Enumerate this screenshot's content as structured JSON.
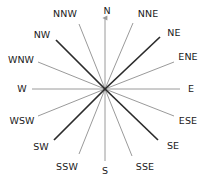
{
  "figure": {
    "background_color": "#ffffff",
    "center": {
      "x": 105,
      "y": 89
    },
    "line_colors": {
      "primary": "#2b2b2b",
      "secondary": "#9a9a9a"
    },
    "text_color": "#1a1a1a",
    "north_arrow": {
      "present": true,
      "points_to": "N",
      "color": "#9a9a9a"
    }
  },
  "chart_data": {
    "type": "diagram",
    "subtype": "compass-rose",
    "center": {
      "x": 105,
      "y": 89
    },
    "point_count": 16,
    "labels": [
      "N",
      "NNE",
      "NE",
      "ENE",
      "E",
      "ESE",
      "SE",
      "SSE",
      "S",
      "SSW",
      "SW",
      "WSW",
      "W",
      "WNW",
      "NW",
      "NNW"
    ],
    "points": [
      {
        "label": "N",
        "bearing_deg": 0,
        "weight": "light",
        "color": "#9a9a9a",
        "ray": {
          "x1": 105,
          "y1": 89,
          "x2": 105,
          "y2": 18
        },
        "label_pos": {
          "x": 107,
          "y": 11
        },
        "arrow": true
      },
      {
        "label": "NNE",
        "bearing_deg": 22.5,
        "weight": "light",
        "color": "#9a9a9a",
        "ray": {
          "x1": 105,
          "y1": 89,
          "x2": 133,
          "y2": 23
        },
        "label_pos": {
          "x": 148,
          "y": 14
        },
        "arrow": false
      },
      {
        "label": "NE",
        "bearing_deg": 45,
        "weight": "dark",
        "color": "#2b2b2b",
        "ray": {
          "x1": 105,
          "y1": 89,
          "x2": 160,
          "y2": 37
        },
        "label_pos": {
          "x": 174,
          "y": 33
        },
        "arrow": false
      },
      {
        "label": "ENE",
        "bearing_deg": 67.5,
        "weight": "light",
        "color": "#9a9a9a",
        "ray": {
          "x1": 105,
          "y1": 89,
          "x2": 174,
          "y2": 62
        },
        "label_pos": {
          "x": 188,
          "y": 57
        },
        "arrow": false
      },
      {
        "label": "E",
        "bearing_deg": 90,
        "weight": "light",
        "color": "#9a9a9a",
        "ray": {
          "x1": 105,
          "y1": 89,
          "x2": 180,
          "y2": 89
        },
        "label_pos": {
          "x": 191,
          "y": 89
        },
        "arrow": false
      },
      {
        "label": "ESE",
        "bearing_deg": 112.5,
        "weight": "light",
        "color": "#9a9a9a",
        "ray": {
          "x1": 105,
          "y1": 89,
          "x2": 174,
          "y2": 116
        },
        "label_pos": {
          "x": 188,
          "y": 121
        },
        "arrow": false
      },
      {
        "label": "SE",
        "bearing_deg": 135,
        "weight": "dark",
        "color": "#2b2b2b",
        "ray": {
          "x1": 105,
          "y1": 89,
          "x2": 158,
          "y2": 140
        },
        "label_pos": {
          "x": 173,
          "y": 146
        },
        "arrow": false
      },
      {
        "label": "SSE",
        "bearing_deg": 157.5,
        "weight": "light",
        "color": "#9a9a9a",
        "ray": {
          "x1": 105,
          "y1": 89,
          "x2": 132,
          "y2": 156
        },
        "label_pos": {
          "x": 145,
          "y": 167
        },
        "arrow": false
      },
      {
        "label": "S",
        "bearing_deg": 180,
        "weight": "light",
        "color": "#9a9a9a",
        "ray": {
          "x1": 105,
          "y1": 89,
          "x2": 105,
          "y2": 161
        },
        "label_pos": {
          "x": 105,
          "y": 171
        },
        "arrow": false
      },
      {
        "label": "SSW",
        "bearing_deg": 202.5,
        "weight": "light",
        "color": "#9a9a9a",
        "ray": {
          "x1": 105,
          "y1": 89,
          "x2": 79,
          "y2": 154
        },
        "label_pos": {
          "x": 67,
          "y": 167
        },
        "arrow": false
      },
      {
        "label": "SW",
        "bearing_deg": 225,
        "weight": "dark",
        "color": "#2b2b2b",
        "ray": {
          "x1": 105,
          "y1": 89,
          "x2": 54,
          "y2": 140
        },
        "label_pos": {
          "x": 41,
          "y": 147
        },
        "arrow": false
      },
      {
        "label": "WSW",
        "bearing_deg": 247.5,
        "weight": "light",
        "color": "#9a9a9a",
        "ray": {
          "x1": 105,
          "y1": 89,
          "x2": 38,
          "y2": 116
        },
        "label_pos": {
          "x": 22,
          "y": 121
        },
        "arrow": false
      },
      {
        "label": "W",
        "bearing_deg": 270,
        "weight": "light",
        "color": "#9a9a9a",
        "ray": {
          "x1": 105,
          "y1": 89,
          "x2": 32,
          "y2": 89
        },
        "label_pos": {
          "x": 22,
          "y": 89
        },
        "arrow": false
      },
      {
        "label": "WNW",
        "bearing_deg": 292.5,
        "weight": "light",
        "color": "#9a9a9a",
        "ray": {
          "x1": 105,
          "y1": 89,
          "x2": 38,
          "y2": 62
        },
        "label_pos": {
          "x": 21,
          "y": 60
        },
        "arrow": false
      },
      {
        "label": "NW",
        "bearing_deg": 315,
        "weight": "dark",
        "color": "#2b2b2b",
        "ray": {
          "x1": 105,
          "y1": 89,
          "x2": 56,
          "y2": 40
        },
        "label_pos": {
          "x": 42,
          "y": 35
        },
        "arrow": false
      },
      {
        "label": "NNW",
        "bearing_deg": 337.5,
        "weight": "light",
        "color": "#9a9a9a",
        "ray": {
          "x1": 105,
          "y1": 89,
          "x2": 79,
          "y2": 24
        },
        "label_pos": {
          "x": 65,
          "y": 14
        },
        "arrow": false
      }
    ],
    "xlabel": "",
    "ylabel": "",
    "grid": false,
    "legend": false
  }
}
